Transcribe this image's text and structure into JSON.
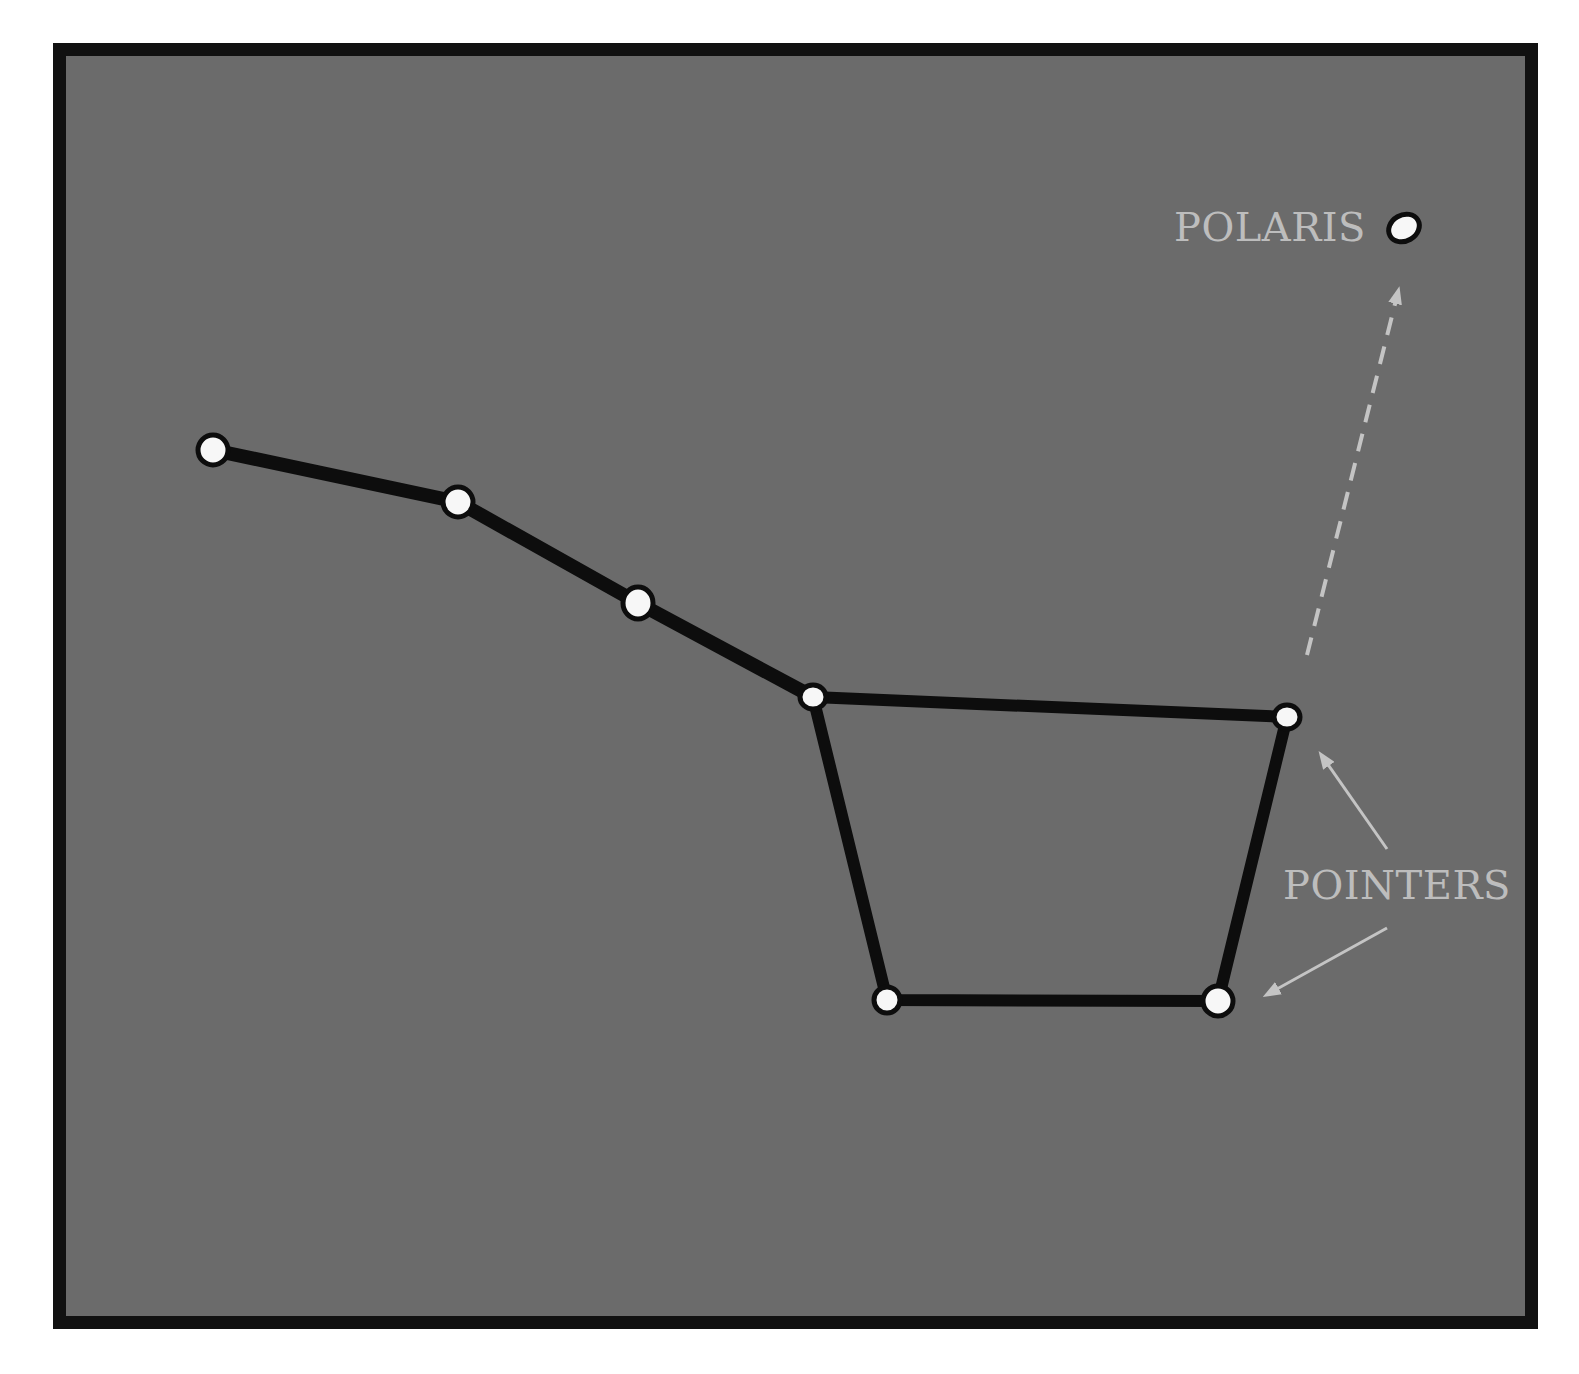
{
  "diagram": {
    "colors": {
      "background": "#6b6b6b",
      "frame": "#111111",
      "line": "#0d0d0d",
      "star_fill": "#f7f7f7",
      "label": "#bdbdbd",
      "arrow": "#c4c4c4"
    },
    "labels": {
      "polaris": "POLARIS",
      "pointers": "POINTERS"
    },
    "stars": [
      {
        "id": "handle-end",
        "x": 213,
        "y": 450,
        "r": 15
      },
      {
        "id": "handle-2",
        "x": 458,
        "y": 502,
        "r": 15
      },
      {
        "id": "handle-3",
        "x": 638,
        "y": 603,
        "r": 15
      },
      {
        "id": "bowl-top-left",
        "x": 813,
        "y": 697,
        "r": 13
      },
      {
        "id": "bowl-top-right-pointer",
        "x": 1287,
        "y": 717,
        "r": 13
      },
      {
        "id": "bowl-bottom-right-pointer",
        "x": 1218,
        "y": 1001,
        "r": 15
      },
      {
        "id": "bowl-bottom-left",
        "x": 887,
        "y": 1000,
        "r": 13
      },
      {
        "id": "polaris",
        "x": 1404,
        "y": 228,
        "r": 15
      }
    ],
    "edges": [
      [
        "handle-end",
        "handle-2"
      ],
      [
        "handle-2",
        "handle-3"
      ],
      [
        "handle-3",
        "bowl-top-left"
      ],
      [
        "bowl-top-left",
        "bowl-top-right-pointer"
      ],
      [
        "bowl-top-right-pointer",
        "bowl-bottom-right-pointer"
      ],
      [
        "bowl-bottom-right-pointer",
        "bowl-bottom-left"
      ],
      [
        "bowl-bottom-left",
        "bowl-top-left"
      ]
    ]
  }
}
